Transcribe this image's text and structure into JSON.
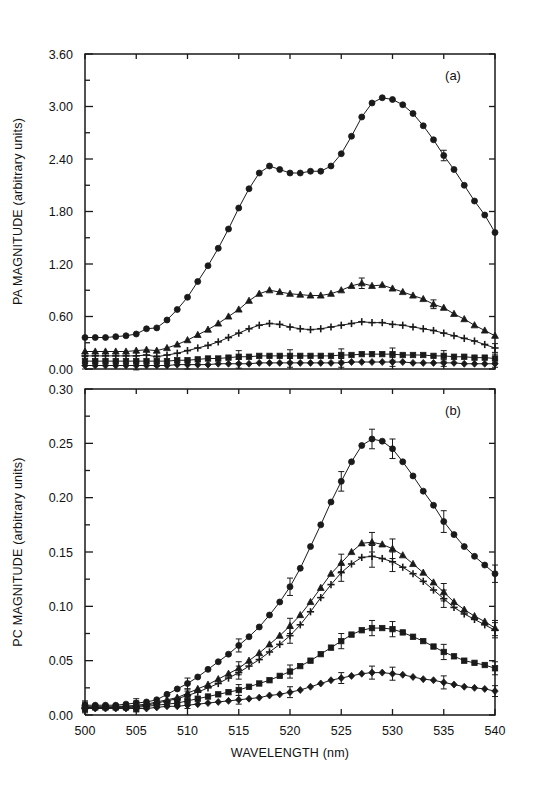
{
  "figure": {
    "background_color": "#ffffff",
    "ink_color": "#1a1a1a",
    "xlabel": "WAVELENGTH (nm)",
    "x_ticks": [
      "500",
      "505",
      "510",
      "515",
      "520",
      "525",
      "530",
      "535",
      "540"
    ]
  },
  "panels": {
    "a": {
      "label": "(a)",
      "ylabel": "PA MAGNITUDE (arbitrary units)",
      "y_ticks": [
        "0.00",
        "0.60",
        "1.20",
        "1.80",
        "2.40",
        "3.00",
        "3.60"
      ]
    },
    "b": {
      "label": "(b)",
      "ylabel": "PC MAGNITUDE (arbitrary units)",
      "y_ticks": [
        "0.00",
        "0.05",
        "0.10",
        "0.15",
        "0.20",
        "0.25",
        "0.30"
      ]
    }
  },
  "chart_data": [
    {
      "type": "line",
      "panel": "a",
      "title": "(a)",
      "xlabel": "WAVELENGTH (nm)",
      "ylabel": "PA MAGNITUDE (arbitrary units)",
      "xlim": [
        500,
        540
      ],
      "ylim": [
        0.0,
        3.6
      ],
      "xticks": [
        500,
        505,
        510,
        515,
        520,
        525,
        530,
        535,
        540
      ],
      "yticks": [
        0.0,
        0.6,
        1.2,
        1.8,
        2.4,
        3.0,
        3.6
      ],
      "grid": false,
      "legend": "none",
      "x": [
        500,
        501,
        502,
        503,
        504,
        505,
        506,
        507,
        508,
        509,
        510,
        511,
        512,
        513,
        514,
        515,
        516,
        517,
        518,
        519,
        520,
        521,
        522,
        523,
        524,
        525,
        526,
        527,
        528,
        529,
        530,
        531,
        532,
        533,
        534,
        535,
        536,
        537,
        538,
        539,
        540
      ],
      "series": [
        {
          "name": "series-1",
          "marker": "circle",
          "values": [
            0.36,
            0.36,
            0.36,
            0.37,
            0.38,
            0.4,
            0.46,
            0.47,
            0.56,
            0.68,
            0.82,
            1.0,
            1.18,
            1.38,
            1.6,
            1.84,
            2.06,
            2.24,
            2.32,
            2.28,
            2.24,
            2.24,
            2.26,
            2.26,
            2.32,
            2.46,
            2.66,
            2.88,
            3.04,
            3.1,
            3.08,
            3.02,
            2.92,
            2.78,
            2.62,
            2.44,
            2.28,
            2.1,
            1.92,
            1.76,
            1.56
          ],
          "errors": [
            0.0,
            0.0,
            0.0,
            0.0,
            0.0,
            0.0,
            0.0,
            0.0,
            0.0,
            0.0,
            0.0,
            0.0,
            0.0,
            0.0,
            0.0,
            0.0,
            0.0,
            0.0,
            0.0,
            0.0,
            0.0,
            0.0,
            0.0,
            0.0,
            0.0,
            0.0,
            0.0,
            0.0,
            0.0,
            0.0,
            0.0,
            0.0,
            0.0,
            0.0,
            0.0,
            0.06,
            0.0,
            0.0,
            0.0,
            0.0,
            0.0
          ]
        },
        {
          "name": "series-2",
          "marker": "triangle",
          "values": [
            0.2,
            0.2,
            0.2,
            0.2,
            0.2,
            0.21,
            0.22,
            0.21,
            0.24,
            0.28,
            0.33,
            0.39,
            0.45,
            0.52,
            0.6,
            0.68,
            0.78,
            0.86,
            0.9,
            0.88,
            0.86,
            0.85,
            0.84,
            0.84,
            0.86,
            0.9,
            0.95,
            0.98,
            0.95,
            0.96,
            0.92,
            0.88,
            0.84,
            0.8,
            0.74,
            0.7,
            0.63,
            0.57,
            0.5,
            0.44,
            0.38
          ],
          "errors": [
            0.0,
            0.0,
            0.0,
            0.0,
            0.0,
            0.0,
            0.0,
            0.0,
            0.0,
            0.0,
            0.0,
            0.0,
            0.0,
            0.0,
            0.0,
            0.0,
            0.0,
            0.0,
            0.0,
            0.0,
            0.0,
            0.0,
            0.0,
            0.0,
            0.0,
            0.0,
            0.0,
            0.06,
            0.0,
            0.0,
            0.0,
            0.0,
            0.0,
            0.0,
            0.05,
            0.0,
            0.0,
            0.0,
            0.0,
            0.0,
            0.0
          ]
        },
        {
          "name": "series-3",
          "marker": "plus",
          "values": [
            0.15,
            0.15,
            0.15,
            0.15,
            0.15,
            0.15,
            0.16,
            0.14,
            0.16,
            0.18,
            0.21,
            0.24,
            0.27,
            0.31,
            0.36,
            0.41,
            0.46,
            0.5,
            0.52,
            0.51,
            0.48,
            0.46,
            0.45,
            0.46,
            0.48,
            0.5,
            0.52,
            0.54,
            0.53,
            0.53,
            0.51,
            0.5,
            0.48,
            0.46,
            0.44,
            0.41,
            0.38,
            0.35,
            0.32,
            0.28,
            0.24
          ],
          "errors": [
            0.0,
            0.0,
            0.0,
            0.0,
            0.0,
            0.0,
            0.0,
            0.0,
            0.0,
            0.0,
            0.0,
            0.0,
            0.0,
            0.0,
            0.0,
            0.0,
            0.0,
            0.0,
            0.0,
            0.0,
            0.0,
            0.0,
            0.0,
            0.0,
            0.0,
            0.0,
            0.0,
            0.0,
            0.0,
            0.0,
            0.0,
            0.0,
            0.0,
            0.0,
            0.0,
            0.0,
            0.0,
            0.0,
            0.0,
            0.0,
            0.05
          ]
        },
        {
          "name": "series-4",
          "marker": "square",
          "values": [
            0.09,
            0.09,
            0.09,
            0.09,
            0.09,
            0.09,
            0.09,
            0.09,
            0.09,
            0.1,
            0.1,
            0.11,
            0.12,
            0.12,
            0.13,
            0.14,
            0.14,
            0.15,
            0.15,
            0.15,
            0.15,
            0.15,
            0.15,
            0.15,
            0.15,
            0.16,
            0.16,
            0.17,
            0.17,
            0.17,
            0.17,
            0.16,
            0.16,
            0.16,
            0.15,
            0.15,
            0.14,
            0.14,
            0.13,
            0.13,
            0.12
          ],
          "errors": [
            0.05,
            0.0,
            0.0,
            0.0,
            0.0,
            0.0,
            0.0,
            0.06,
            0.0,
            0.0,
            0.0,
            0.0,
            0.0,
            0.0,
            0.0,
            0.07,
            0.0,
            0.0,
            0.0,
            0.0,
            0.07,
            0.0,
            0.0,
            0.0,
            0.0,
            0.07,
            0.0,
            0.0,
            0.0,
            0.0,
            0.07,
            0.0,
            0.0,
            0.0,
            0.0,
            0.06,
            0.0,
            0.0,
            0.0,
            0.0,
            0.05
          ]
        },
        {
          "name": "series-5",
          "marker": "diamond",
          "values": [
            0.04,
            0.04,
            0.04,
            0.04,
            0.04,
            0.04,
            0.04,
            0.04,
            0.04,
            0.05,
            0.05,
            0.05,
            0.05,
            0.06,
            0.06,
            0.06,
            0.06,
            0.07,
            0.07,
            0.07,
            0.07,
            0.07,
            0.07,
            0.07,
            0.07,
            0.07,
            0.08,
            0.08,
            0.08,
            0.08,
            0.08,
            0.08,
            0.07,
            0.07,
            0.07,
            0.07,
            0.07,
            0.06,
            0.06,
            0.06,
            0.06
          ],
          "errors": [
            0.04,
            0.0,
            0.0,
            0.0,
            0.0,
            0.05,
            0.0,
            0.0,
            0.0,
            0.0,
            0.05,
            0.0,
            0.0,
            0.0,
            0.0,
            0.05,
            0.0,
            0.0,
            0.0,
            0.0,
            0.05,
            0.0,
            0.0,
            0.0,
            0.0,
            0.05,
            0.0,
            0.0,
            0.0,
            0.0,
            0.05,
            0.0,
            0.0,
            0.0,
            0.0,
            0.04,
            0.0,
            0.0,
            0.0,
            0.0,
            0.04
          ]
        }
      ]
    },
    {
      "type": "line",
      "panel": "b",
      "title": "(b)",
      "xlabel": "WAVELENGTH (nm)",
      "ylabel": "PC MAGNITUDE (arbitrary units)",
      "xlim": [
        500,
        540
      ],
      "ylim": [
        0.0,
        0.3
      ],
      "xticks": [
        500,
        505,
        510,
        515,
        520,
        525,
        530,
        535,
        540
      ],
      "yticks": [
        0.0,
        0.05,
        0.1,
        0.15,
        0.2,
        0.25,
        0.3
      ],
      "grid": false,
      "legend": "none",
      "x": [
        500,
        501,
        502,
        503,
        504,
        505,
        506,
        507,
        508,
        509,
        510,
        511,
        512,
        513,
        514,
        515,
        516,
        517,
        518,
        519,
        520,
        521,
        522,
        523,
        524,
        525,
        526,
        527,
        528,
        529,
        530,
        531,
        532,
        533,
        534,
        535,
        536,
        537,
        538,
        539,
        540
      ],
      "series": [
        {
          "name": "series-1",
          "marker": "circle",
          "values": [
            0.009,
            0.009,
            0.009,
            0.009,
            0.01,
            0.011,
            0.012,
            0.014,
            0.019,
            0.024,
            0.029,
            0.035,
            0.042,
            0.049,
            0.056,
            0.064,
            0.072,
            0.081,
            0.092,
            0.104,
            0.118,
            0.135,
            0.155,
            0.175,
            0.196,
            0.215,
            0.233,
            0.248,
            0.254,
            0.252,
            0.245,
            0.233,
            0.22,
            0.206,
            0.193,
            0.178,
            0.166,
            0.155,
            0.146,
            0.138,
            0.13
          ],
          "errors": [
            0.004,
            0.0,
            0.0,
            0.0,
            0.0,
            0.004,
            0.0,
            0.0,
            0.0,
            0.0,
            0.005,
            0.0,
            0.0,
            0.0,
            0.0,
            0.006,
            0.0,
            0.0,
            0.0,
            0.0,
            0.008,
            0.0,
            0.0,
            0.0,
            0.0,
            0.009,
            0.0,
            0.0,
            0.009,
            0.0,
            0.009,
            0.0,
            0.0,
            0.0,
            0.0,
            0.01,
            0.0,
            0.0,
            0.0,
            0.0,
            0.008
          ]
        },
        {
          "name": "series-2",
          "marker": "triangle",
          "values": [
            0.008,
            0.008,
            0.008,
            0.008,
            0.008,
            0.009,
            0.01,
            0.012,
            0.014,
            0.016,
            0.02,
            0.024,
            0.028,
            0.033,
            0.038,
            0.043,
            0.05,
            0.057,
            0.065,
            0.073,
            0.082,
            0.092,
            0.104,
            0.117,
            0.13,
            0.14,
            0.15,
            0.158,
            0.159,
            0.157,
            0.153,
            0.147,
            0.139,
            0.131,
            0.122,
            0.113,
            0.104,
            0.097,
            0.091,
            0.086,
            0.08
          ],
          "errors": [
            0.004,
            0.0,
            0.0,
            0.0,
            0.0,
            0.004,
            0.0,
            0.0,
            0.0,
            0.0,
            0.004,
            0.0,
            0.0,
            0.0,
            0.0,
            0.006,
            0.0,
            0.0,
            0.0,
            0.0,
            0.007,
            0.0,
            0.0,
            0.0,
            0.0,
            0.008,
            0.0,
            0.0,
            0.009,
            0.0,
            0.009,
            0.0,
            0.0,
            0.0,
            0.0,
            0.008,
            0.0,
            0.0,
            0.0,
            0.0,
            0.007
          ]
        },
        {
          "name": "series-3",
          "marker": "plus",
          "values": [
            0.007,
            0.007,
            0.007,
            0.007,
            0.008,
            0.008,
            0.009,
            0.011,
            0.013,
            0.015,
            0.018,
            0.021,
            0.025,
            0.029,
            0.034,
            0.039,
            0.045,
            0.051,
            0.058,
            0.065,
            0.073,
            0.083,
            0.095,
            0.108,
            0.12,
            0.131,
            0.139,
            0.145,
            0.146,
            0.144,
            0.141,
            0.136,
            0.13,
            0.123,
            0.115,
            0.107,
            0.099,
            0.093,
            0.088,
            0.083,
            0.078
          ],
          "errors": [
            0.004,
            0.0,
            0.0,
            0.0,
            0.0,
            0.004,
            0.0,
            0.0,
            0.0,
            0.0,
            0.004,
            0.0,
            0.0,
            0.0,
            0.0,
            0.006,
            0.0,
            0.0,
            0.0,
            0.0,
            0.007,
            0.0,
            0.0,
            0.0,
            0.0,
            0.008,
            0.0,
            0.0,
            0.01,
            0.0,
            0.009,
            0.0,
            0.0,
            0.0,
            0.0,
            0.008,
            0.0,
            0.0,
            0.0,
            0.0,
            0.007
          ]
        },
        {
          "name": "series-4",
          "marker": "square",
          "values": [
            0.007,
            0.007,
            0.007,
            0.007,
            0.007,
            0.007,
            0.008,
            0.009,
            0.01,
            0.011,
            0.013,
            0.015,
            0.017,
            0.019,
            0.021,
            0.023,
            0.026,
            0.029,
            0.032,
            0.036,
            0.04,
            0.045,
            0.05,
            0.056,
            0.062,
            0.068,
            0.074,
            0.078,
            0.08,
            0.08,
            0.079,
            0.076,
            0.072,
            0.068,
            0.063,
            0.058,
            0.054,
            0.05,
            0.048,
            0.046,
            0.043
          ],
          "errors": [
            0.004,
            0.0,
            0.0,
            0.0,
            0.0,
            0.004,
            0.0,
            0.0,
            0.0,
            0.0,
            0.004,
            0.0,
            0.0,
            0.0,
            0.0,
            0.005,
            0.0,
            0.0,
            0.0,
            0.0,
            0.006,
            0.0,
            0.0,
            0.0,
            0.0,
            0.007,
            0.0,
            0.0,
            0.007,
            0.0,
            0.007,
            0.0,
            0.0,
            0.0,
            0.0,
            0.007,
            0.0,
            0.0,
            0.0,
            0.0,
            0.006
          ]
        },
        {
          "name": "series-5",
          "marker": "diamond",
          "values": [
            0.006,
            0.006,
            0.006,
            0.006,
            0.006,
            0.006,
            0.006,
            0.007,
            0.008,
            0.008,
            0.009,
            0.01,
            0.011,
            0.012,
            0.013,
            0.014,
            0.015,
            0.016,
            0.018,
            0.019,
            0.021,
            0.023,
            0.026,
            0.029,
            0.032,
            0.034,
            0.036,
            0.038,
            0.039,
            0.039,
            0.038,
            0.037,
            0.035,
            0.033,
            0.032,
            0.03,
            0.028,
            0.026,
            0.025,
            0.024,
            0.022
          ],
          "errors": [
            0.004,
            0.0,
            0.0,
            0.0,
            0.0,
            0.003,
            0.0,
            0.0,
            0.0,
            0.0,
            0.003,
            0.0,
            0.0,
            0.0,
            0.0,
            0.004,
            0.0,
            0.0,
            0.0,
            0.0,
            0.005,
            0.0,
            0.0,
            0.0,
            0.0,
            0.005,
            0.0,
            0.0,
            0.006,
            0.0,
            0.006,
            0.0,
            0.0,
            0.0,
            0.0,
            0.006,
            0.0,
            0.0,
            0.0,
            0.0,
            0.005
          ]
        }
      ]
    }
  ]
}
